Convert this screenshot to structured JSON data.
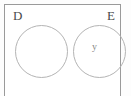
{
  "diagram": {
    "type": "set-diagram",
    "universe": {
      "name": "universal-set-box",
      "border_color": "#9a9a9a",
      "background_color": "#ffffff"
    },
    "sets": [
      {
        "label": "D",
        "members": [],
        "stroke_color": "#b4b4b4"
      },
      {
        "label": "E",
        "members": [
          "y"
        ],
        "stroke_color": "#b4b4b4"
      }
    ],
    "elements": [
      {
        "label": "y",
        "in_set": "E"
      }
    ]
  }
}
